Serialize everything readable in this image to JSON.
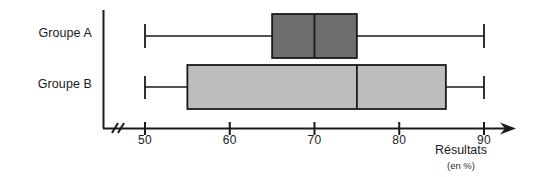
{
  "chart_data": {
    "type": "box",
    "title": "",
    "xlabel": "Résultats",
    "xlabel_units": "(en %)",
    "ylabel": "",
    "orientation": "horizontal",
    "xlim": [
      46,
      94
    ],
    "axis_break": true,
    "grid": false,
    "legend": "none",
    "xticks": [
      50,
      60,
      70,
      80,
      90
    ],
    "xtick_labels": [
      "50",
      "60",
      "70",
      "80",
      "90"
    ],
    "categories": [
      "Groupe A",
      "Groupe B"
    ],
    "series": [
      {
        "name": "Groupe A",
        "min": 50,
        "q1": 65,
        "median": 70,
        "q3": 75,
        "max": 90,
        "color": "#6e6e6e"
      },
      {
        "name": "Groupe B",
        "min": 50,
        "q1": 55,
        "median": 75,
        "q3": 85.5,
        "max": 90,
        "color": "#bdbdbd"
      }
    ]
  },
  "labels": {
    "group_a": "Groupe A",
    "group_b": "Groupe B",
    "tick_50": "50",
    "tick_60": "60",
    "tick_70": "70",
    "tick_80": "80",
    "tick_90": "90",
    "axis_title": "Résultats",
    "axis_units": "(en %)"
  },
  "colors": {
    "box_a_fill": "#6e6e6e",
    "box_b_fill": "#bdbdbd",
    "stroke": "#1a1a1a",
    "background": "#ffffff"
  }
}
